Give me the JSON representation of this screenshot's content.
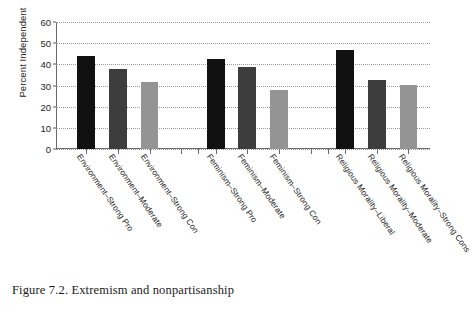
{
  "figure": {
    "caption": "Figure 7.2. Extremism and nonpartisanship"
  },
  "chart_data": {
    "type": "bar",
    "title": "",
    "xlabel": "",
    "ylabel": "Percent Independent",
    "ylim": [
      0,
      60
    ],
    "yticks": [
      0,
      10,
      20,
      30,
      40,
      50,
      60
    ],
    "ytick_labels": [
      "0",
      "10",
      "20",
      "30",
      "40",
      "50",
      "60"
    ],
    "grid": "horizontal-dotted",
    "legend": "none",
    "categories": [
      "Environment–Strong Pro",
      "Environment–Moderate",
      "Environment–Strong Con",
      "Feminism–Strong Pro",
      "Feminism–Moderate",
      "Feminism–Strong Con",
      "Religious Morality–Liberal",
      "Religious Morality–Moderate",
      "Religious Morality–Strong Cons"
    ],
    "values": [
      44.0,
      38.0,
      31.5,
      42.5,
      38.8,
      28.0,
      47.0,
      32.6,
      30.4
    ],
    "bar_colors": [
      "#111111",
      "#3d3d3d",
      "#949494",
      "#111111",
      "#3d3d3d",
      "#949494",
      "#111111",
      "#3d3d3d",
      "#949494"
    ],
    "groups": [
      {
        "name": "Environment",
        "categories": [
          "Environment–Strong Pro",
          "Environment–Moderate",
          "Environment–Strong Con"
        ],
        "values": [
          44.0,
          38.0,
          31.5
        ]
      },
      {
        "name": "Feminism",
        "categories": [
          "Feminism–Strong Pro",
          "Feminism–Moderate",
          "Feminism–Strong Con"
        ],
        "values": [
          42.5,
          38.8,
          28.0
        ]
      },
      {
        "name": "Religious Morality",
        "categories": [
          "Religious Morality–Liberal",
          "Religious Morality–Moderate",
          "Religious Morality–Strong Cons"
        ],
        "values": [
          47.0,
          32.6,
          30.4
        ]
      }
    ],
    "series_shades": {
      "strong_pro_or_liberal": "#111111",
      "moderate": "#3d3d3d",
      "strong_con": "#949494"
    }
  }
}
